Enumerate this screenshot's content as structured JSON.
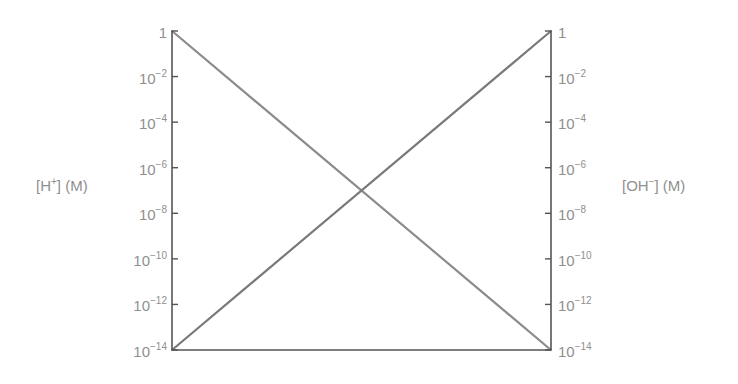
{
  "chart_data": {
    "type": "line",
    "title": "",
    "xlabel": "",
    "ylabel_left": "[H+] (M)",
    "ylabel_right": "[OH−] (M)",
    "y_scale": "log10",
    "ylim": [
      1e-14,
      1
    ],
    "x": [
      0,
      1
    ],
    "yticks_exponents": [
      0,
      -2,
      -4,
      -6,
      -8,
      -10,
      -12,
      -14
    ],
    "series": [
      {
        "name": "[H+]",
        "axis": "left",
        "values": [
          1,
          1e-14
        ],
        "color": "#8c8c8c"
      },
      {
        "name": "[OH−]",
        "axis": "right",
        "values": [
          1e-14,
          1
        ],
        "color": "#7a7a7a"
      }
    ],
    "grid": false,
    "legend": "none",
    "annotations": []
  },
  "axes": {
    "left": {
      "title_base": "[H",
      "title_sup": "+",
      "title_rest": "] (M)",
      "ticks": [
        {
          "base": "1",
          "exp": ""
        },
        {
          "base": "10",
          "exp": "−2"
        },
        {
          "base": "10",
          "exp": "−4"
        },
        {
          "base": "10",
          "exp": "−6"
        },
        {
          "base": "10",
          "exp": "−8"
        },
        {
          "base": "10",
          "exp": "−10"
        },
        {
          "base": "10",
          "exp": "−12"
        },
        {
          "base": "10",
          "exp": "−14"
        }
      ]
    },
    "right": {
      "title_base": "[OH",
      "title_sup": "−",
      "title_rest": "] (M)",
      "ticks": [
        {
          "base": "1",
          "exp": ""
        },
        {
          "base": "10",
          "exp": "−2"
        },
        {
          "base": "10",
          "exp": "−4"
        },
        {
          "base": "10",
          "exp": "−6"
        },
        {
          "base": "10",
          "exp": "−8"
        },
        {
          "base": "10",
          "exp": "−10"
        },
        {
          "base": "10",
          "exp": "−12"
        },
        {
          "base": "10",
          "exp": "−14"
        }
      ]
    }
  },
  "colors": {
    "axis": "#555555",
    "h_line": "#8c8c8c",
    "oh_line": "#7a7a7a",
    "label": "#8f8f8f"
  }
}
